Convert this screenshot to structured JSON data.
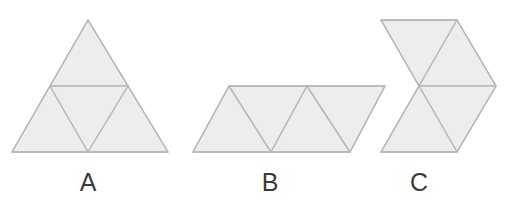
{
  "figure": {
    "background_color": "#ffffff",
    "fill_color": "#ededed",
    "stroke_color": "#b8b8b8",
    "label_color": "#3a3a3a",
    "stroke_width": 1.4,
    "width": 506,
    "height": 205
  },
  "shapes": [
    {
      "id": "A",
      "label": "A",
      "name": "large-triangle",
      "description": "Equilateral triangle subdivided into four congruent smaller equilateral triangles",
      "outline": "88,20 168,152 12,152",
      "label_x": 88,
      "label_y": 170,
      "pieces": [
        {
          "name": "piece-top",
          "points": "88,20 128,86 50,86"
        },
        {
          "name": "piece-bottom-left",
          "points": "50,86 88,152 12,152"
        },
        {
          "name": "piece-center-inverted",
          "points": "50,86 128,86 88,152"
        },
        {
          "name": "piece-bottom-right",
          "points": "128,86 168,152 88,152"
        }
      ]
    },
    {
      "id": "B",
      "label": "B",
      "name": "parallelogram",
      "description": "Parallelogram strip made of four congruent equilateral triangles in an alternating row",
      "outline": "229,86 385,86 350,152 193,152",
      "label_x": 270,
      "label_y": 170,
      "pieces": [
        {
          "name": "piece-1-down",
          "points": "229,86 271,152 193,152"
        },
        {
          "name": "piece-2-up",
          "points": "229,86 307,86 271,152"
        },
        {
          "name": "piece-3-down",
          "points": "307,86 350,152 271,152"
        },
        {
          "name": "piece-4-up",
          "points": "307,86 385,86 350,152"
        }
      ]
    },
    {
      "id": "C",
      "label": "C",
      "name": "bowtie-hourglass",
      "description": "Hourglass arrangement of four congruent equilateral triangles meeting at a central waist point",
      "outline": "381,20 457,20 496,86 457,152 381,152 419,86",
      "label_x": 419,
      "label_y": 170,
      "pieces": [
        {
          "name": "piece-top-left-down",
          "points": "381,20 457,20 419,86"
        },
        {
          "name": "piece-top-right-down",
          "points": "457,20 496,86 419,86"
        },
        {
          "name": "piece-bottom-right-up",
          "points": "419,86 496,86 457,152"
        },
        {
          "name": "piece-bottom-left-up",
          "points": "419,86 457,152 381,152"
        }
      ]
    }
  ]
}
